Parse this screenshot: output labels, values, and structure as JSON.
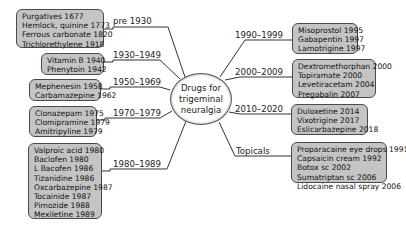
{
  "center": {
    "lines": [
      "Drugs for",
      "trigeminal",
      "neuralgia"
    ]
  },
  "branches": [
    {
      "label": "pre 1930",
      "items": [
        "Purgatives 1677",
        "Hemlock, quinine 1773",
        "Ferrous carbonate 1820",
        "Trichlorethylene 1918"
      ]
    },
    {
      "label": "1930–1949",
      "items": [
        "Vitamin B 1940",
        "Phenytoin 1942"
      ]
    },
    {
      "label": "1950–1969",
      "items": [
        "Mephenesin 1958",
        "Carbamazepine 1962"
      ]
    },
    {
      "label": "1970–1979",
      "items": [
        "Clonazepam 1975",
        "Clomipramine 1979",
        "Amitripyline 1979"
      ]
    },
    {
      "label": "1980–1989",
      "items": [
        "Valproic acid 1980",
        "Baclofen 1980",
        "L Bacofen 1986",
        "Tizanidine 1986",
        "Oxcarbazepine 1987",
        "Tocainide 1987",
        "Pimozide 1988",
        "Mexiletine 1989"
      ]
    },
    {
      "label": "1990–1999",
      "items": [
        "Misoprostol 1995",
        "Gabapentin 1997",
        "Lamotrigine 1997"
      ]
    },
    {
      "label": "2000–2009",
      "items": [
        "Dextromethorphan 2000",
        "Topiramate 2000",
        "Levetiracetam 2004",
        "Pregabalin 2007"
      ]
    },
    {
      "label": "2010–2020",
      "items": [
        "Duloxetine 2014",
        "Vixotrigine 2017",
        "Eslicarbazepine 2018"
      ]
    },
    {
      "label": "Topicals",
      "items": [
        "Proparacaine eye drops 1991",
        "Capsaicin cream 1992",
        "Botox sc 2002",
        "Sumatriptan sc 2006",
        "Lidocaine nasal spray 2006"
      ]
    }
  ]
}
